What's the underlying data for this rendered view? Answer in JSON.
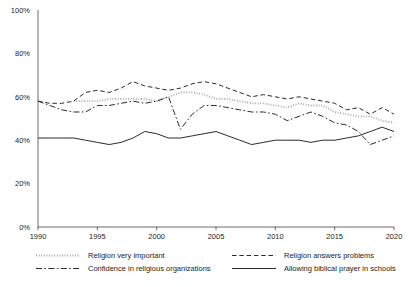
{
  "chart_data": {
    "type": "line",
    "title": "",
    "subtitle": "",
    "xlabel": "",
    "ylabel": "",
    "xlim": [
      1990,
      2020
    ],
    "ylim": [
      0,
      100
    ],
    "grid": false,
    "legend_position": "bottom",
    "x_ticks": [
      "1990",
      "1995",
      "2000",
      "2005",
      "2010",
      "2015",
      "2020"
    ],
    "x_tick_values": [
      1990,
      1995,
      2000,
      2005,
      2010,
      2015,
      2020
    ],
    "y_ticks": [
      "0%",
      "20%",
      "40%",
      "60%",
      "80%",
      "100%"
    ],
    "y_tick_values": [
      0,
      20,
      40,
      60,
      80,
      100
    ],
    "series": [
      {
        "name": "Religion very important",
        "style": "dotted",
        "color": "#a8a8a8",
        "x": [
          1993,
          1994,
          1995,
          1996,
          1997,
          1998,
          1999,
          2000,
          2001,
          2002,
          2003,
          2004,
          2005,
          2006,
          2007,
          2008,
          2009,
          2010,
          2011,
          2012,
          2013,
          2014,
          2015,
          2016,
          2017,
          2018,
          2019,
          2020
        ],
        "values": [
          58,
          58,
          58,
          59,
          59,
          59,
          59,
          58,
          60,
          62,
          62,
          61,
          59,
          59,
          58,
          57,
          57,
          56,
          55,
          57,
          56,
          56,
          53,
          52,
          51,
          51,
          49,
          48
        ]
      },
      {
        "name": "Religion answers problems",
        "style": "dashed",
        "color": "#2b2b2b",
        "x": [
          1990,
          1991,
          1992,
          1993,
          1994,
          1995,
          1996,
          1997,
          1998,
          1999,
          2000,
          2001,
          2002,
          2003,
          2004,
          2005,
          2006,
          2007,
          2008,
          2009,
          2010,
          2011,
          2012,
          2013,
          2014,
          2015,
          2016,
          2017,
          2018,
          2019,
          2020
        ],
        "values": [
          58,
          57,
          57,
          58,
          62,
          63,
          62,
          64,
          67,
          65,
          64,
          63,
          64,
          66,
          67,
          66,
          64,
          62,
          60,
          61,
          60,
          59,
          60,
          59,
          58,
          57,
          54,
          55,
          52,
          55,
          52
        ]
      },
      {
        "name": "Confidence in religious organizations",
        "style": "dashdot",
        "color": "#2b2b2b",
        "x": [
          1990,
          1991,
          1992,
          1993,
          1994,
          1995,
          1996,
          1997,
          1998,
          1999,
          2000,
          2001,
          2002,
          2003,
          2004,
          2005,
          2006,
          2007,
          2008,
          2009,
          2010,
          2011,
          2012,
          2013,
          2014,
          2015,
          2016,
          2017,
          2018,
          2019,
          2020
        ],
        "values": [
          58,
          56,
          54,
          53,
          53,
          56,
          56,
          57,
          58,
          57,
          58,
          60,
          45,
          52,
          56,
          56,
          55,
          54,
          53,
          53,
          52,
          49,
          51,
          53,
          51,
          48,
          47,
          44,
          38,
          40,
          42
        ]
      },
      {
        "name": "Allowing biblical prayer in schools",
        "style": "solid",
        "color": "#2b2b2b",
        "x": [
          1990,
          1991,
          1992,
          1993,
          1994,
          1995,
          1996,
          1997,
          1998,
          1999,
          2000,
          2001,
          2002,
          2003,
          2004,
          2005,
          2006,
          2007,
          2008,
          2009,
          2010,
          2011,
          2012,
          2013,
          2014,
          2015,
          2016,
          2017,
          2018,
          2019,
          2020
        ],
        "values": [
          41,
          41,
          41,
          41,
          40,
          39,
          38,
          39,
          41,
          44,
          43,
          41,
          41,
          42,
          43,
          44,
          42,
          40,
          38,
          39,
          40,
          40,
          40,
          39,
          40,
          40,
          41,
          42,
          44,
          46,
          44
        ]
      }
    ]
  },
  "legend": {
    "items": [
      {
        "label": "Religion very important",
        "style": "dotted"
      },
      {
        "label": "Religion answers problems",
        "style": "dashed"
      },
      {
        "label": "Confidence in religious organizations",
        "style": "dashdot"
      },
      {
        "label": "Allowing biblical prayer in schools",
        "style": "solid"
      }
    ]
  }
}
